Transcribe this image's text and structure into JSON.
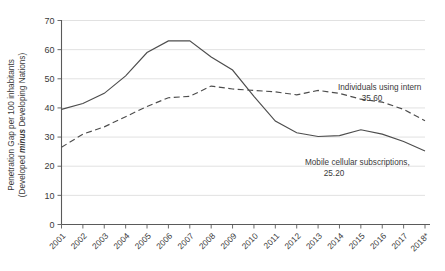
{
  "chart_data": {
    "type": "line",
    "title": "",
    "xlabel": "",
    "ylabel": "Penetration Gap per 100 inhabitants (Developed minus Developing Nations)",
    "ylabel_line1": "Penetration Gap per 100 inhabitants",
    "ylabel_line2_prefix": "(Developed ",
    "ylabel_line2_em": "minus",
    "ylabel_line2_suffix": " Developing Nations)",
    "ylim": [
      0,
      70
    ],
    "yticks": [
      0,
      10,
      20,
      30,
      40,
      50,
      60,
      70
    ],
    "ytick_labels": [
      "0",
      "10",
      "20",
      "30",
      "40",
      "50",
      "60",
      "70"
    ],
    "grid": true,
    "legend_position": "inline-annotation",
    "categories": [
      "2001",
      "2002",
      "2003",
      "2004",
      "2005",
      "2006",
      "2007",
      "2008",
      "2009",
      "2010",
      "2011",
      "2012",
      "2013",
      "2014",
      "2015",
      "2016",
      "2017",
      "2018*"
    ],
    "series": [
      {
        "name": "Mobile cellular subscriptions",
        "style": "solid",
        "annotation_label": "Mobile cellular subscriptions,",
        "annotation_value": "25.20",
        "values": [
          39.5,
          41.5,
          45.0,
          51.0,
          59.0,
          63.0,
          63.0,
          57.5,
          53.0,
          44.0,
          35.5,
          31.5,
          30.2,
          30.5,
          32.5,
          31.0,
          28.5,
          25.2
        ]
      },
      {
        "name": "Individuals using internet",
        "style": "dashed",
        "annotation_label": "Individuals using intern",
        "annotation_value": "35.60",
        "values": [
          26.5,
          31.0,
          33.5,
          37.0,
          40.5,
          43.5,
          44.0,
          47.5,
          46.5,
          46.0,
          45.5,
          44.5,
          46.0,
          45.0,
          43.0,
          42.0,
          39.5,
          35.6
        ]
      }
    ]
  }
}
